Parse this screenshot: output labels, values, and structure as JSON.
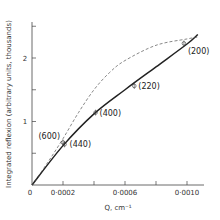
{
  "chart_data": {
    "type": "line",
    "title": "",
    "xlabel": "Q,  cm⁻¹",
    "ylabel": "Integrated reflexion (arbitrary units, thousands)",
    "xlim": [
      0,
      0.00112
    ],
    "ylim": [
      0,
      2.45
    ],
    "x_ticks": [
      {
        "value": 0,
        "label": "0"
      },
      {
        "value": 0.0002,
        "label": "0·0002"
      },
      {
        "value": 0.0004,
        "label": ""
      },
      {
        "value": 0.0006,
        "label": "0·0006"
      },
      {
        "value": 0.0008,
        "label": ""
      },
      {
        "value": 0.001,
        "label": "0·0010"
      }
    ],
    "y_ticks": [
      {
        "value": 0.5,
        "label": ""
      },
      {
        "value": 1,
        "label": "1"
      },
      {
        "value": 1.5,
        "label": ""
      },
      {
        "value": 2,
        "label": "2"
      },
      {
        "value": 2.5,
        "label": ""
      }
    ],
    "grid": false,
    "legend": null,
    "series": [
      {
        "name": "experimental (solid)",
        "style": "solid",
        "x": [
          0,
          0.0002,
          0.0004,
          0.0006,
          0.0008,
          0.001,
          0.00107
        ],
        "y": [
          0,
          0.62,
          1.12,
          1.5,
          1.86,
          2.22,
          2.37
        ]
      },
      {
        "name": "theoretical (dashed)",
        "style": "dashed",
        "x": [
          0,
          0.0001,
          0.0002,
          0.0003,
          0.0004,
          0.0005,
          0.0006,
          0.0008,
          0.001,
          0.00107
        ],
        "y": [
          0,
          0.35,
          0.73,
          1.14,
          1.5,
          1.77,
          1.96,
          2.2,
          2.3,
          2.33
        ]
      }
    ],
    "points": [
      {
        "label": "(440)",
        "x": 0.00021,
        "y": 0.64
      },
      {
        "label": "(600)",
        "x": 0.0002,
        "y": 0.67
      },
      {
        "label": "(400)",
        "x": 0.00041,
        "y": 1.14
      },
      {
        "label": "(220)",
        "x": 0.00066,
        "y": 1.56
      },
      {
        "label": "(200)",
        "x": 0.00098,
        "y": 2.23
      }
    ]
  }
}
